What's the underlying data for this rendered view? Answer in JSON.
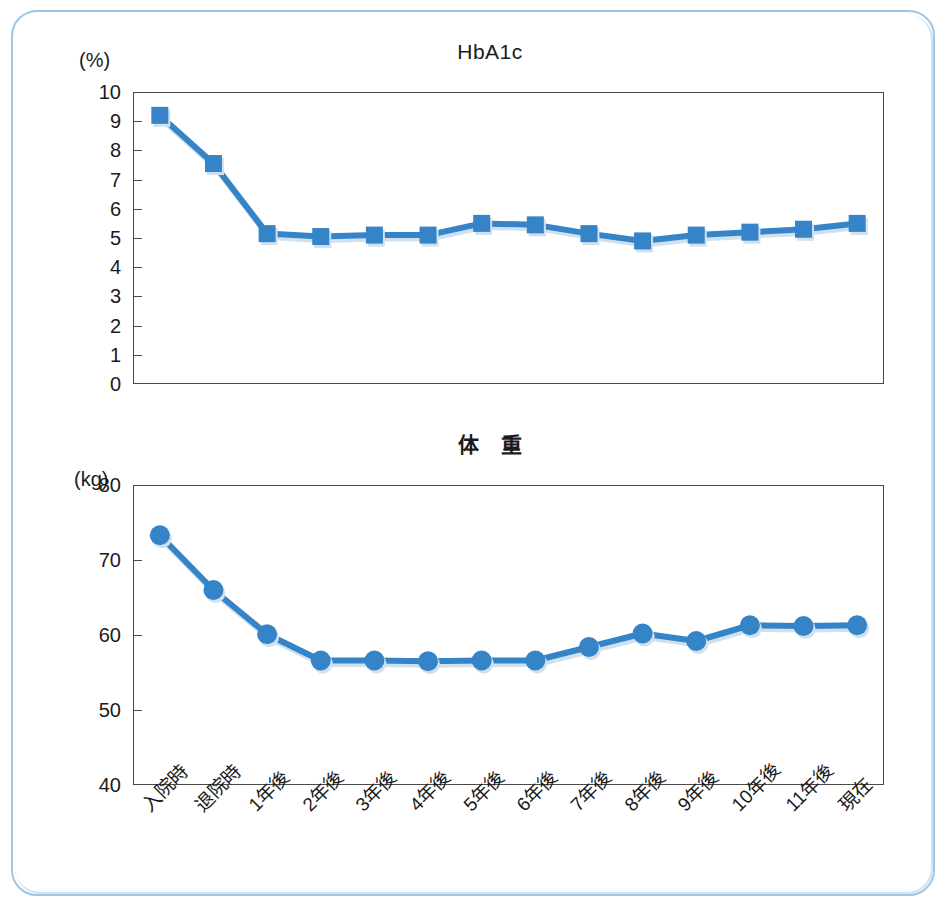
{
  "figure": {
    "border_color": "#9fc6e3",
    "accent_color": "#3584c8",
    "categories": [
      "入院時",
      "退院時",
      "1年後",
      "2年後",
      "3年後",
      "4年後",
      "5年後",
      "6年後",
      "7年後",
      "8年後",
      "9年後",
      "10年後",
      "11年後",
      "現在"
    ]
  },
  "chart_data": [
    {
      "type": "line",
      "title": "HbA1c",
      "xlabel": "",
      "ylabel": "(%)",
      "unit": "(%)",
      "categories": [
        "入院時",
        "退院時",
        "1年後",
        "2年後",
        "3年後",
        "4年後",
        "5年後",
        "6年後",
        "7年後",
        "8年後",
        "9年後",
        "10年後",
        "11年後",
        "現在"
      ],
      "values": [
        9.2,
        7.55,
        5.15,
        5.05,
        5.1,
        5.1,
        5.5,
        5.45,
        5.15,
        4.9,
        5.1,
        5.2,
        5.3,
        5.5
      ],
      "ylim": [
        0,
        10
      ],
      "yticks": [
        0,
        1,
        2,
        3,
        4,
        5,
        6,
        7,
        8,
        9,
        10
      ],
      "ytick_labels": [
        "0",
        "1",
        "2",
        "3",
        "4",
        "5",
        "6",
        "7",
        "8",
        "9",
        "10"
      ],
      "marker": "square",
      "grid": false,
      "legend": "none",
      "series_color": "#3584c8"
    },
    {
      "type": "line",
      "title": "体　重",
      "xlabel": "",
      "ylabel": "(kg)",
      "unit": "(kg)",
      "categories": [
        "入院時",
        "退院時",
        "1年後",
        "2年後",
        "3年後",
        "4年後",
        "5年後",
        "6年後",
        "7年後",
        "8年後",
        "9年後",
        "10年後",
        "11年後",
        "現在"
      ],
      "values": [
        73.3,
        66.0,
        60.1,
        56.6,
        56.6,
        56.5,
        56.6,
        56.6,
        58.4,
        60.2,
        59.2,
        61.3,
        61.2,
        61.3
      ],
      "ylim": [
        40,
        80
      ],
      "yticks": [
        40,
        50,
        60,
        70,
        80
      ],
      "ytick_labels": [
        "40",
        "50",
        "60",
        "70",
        "80"
      ],
      "marker": "circle",
      "grid": false,
      "legend": "none",
      "series_color": "#3584c8"
    }
  ]
}
